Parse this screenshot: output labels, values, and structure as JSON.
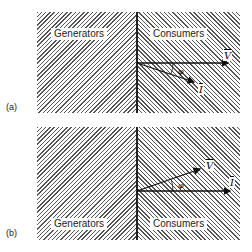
{
  "panels": [
    {
      "tag": "(a)",
      "generators_label": "Generators",
      "consumers_label": "Consumers",
      "voltage_symbol": "V",
      "current_symbol": "I",
      "angle_symbol": "φ",
      "description": "Current lags voltage by angle φ"
    },
    {
      "tag": "(b)",
      "generators_label": "Generators",
      "consumers_label": "Consumers",
      "voltage_symbol": "V",
      "current_symbol": "I",
      "angle_symbol": "φ",
      "description": "Voltage leads current by angle φ"
    }
  ]
}
